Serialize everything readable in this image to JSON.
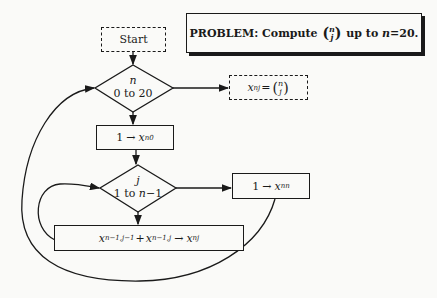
{
  "diagram": {
    "title_box": {
      "prefix": "PROBLEM:",
      "text": "Compute",
      "binom_top": "n",
      "binom_bottom": "j",
      "suffix": "up to",
      "var": "n",
      "eq": "=20."
    },
    "start": {
      "label": "Start"
    },
    "loop_n": {
      "var": "n",
      "range": "0 to 20"
    },
    "output": {
      "var": "x",
      "sub": "nj",
      "eq": "=",
      "binom_top": "n",
      "binom_bottom": "j"
    },
    "init_n0": {
      "value": "1",
      "var": "x",
      "sub": "n0"
    },
    "loop_j": {
      "var": "j",
      "range_start": "1 to ",
      "range_var": "n",
      "range_end": "−1"
    },
    "set_nn": {
      "value": "1",
      "var": "x",
      "sub": "nn"
    },
    "recurrence": {
      "t1_var": "x",
      "t1_sub": "n−1,j−1",
      "plus": "+",
      "t2_var": "x",
      "t2_sub": "n−1,j",
      "target_var": "x",
      "target_sub": "nj"
    },
    "arrow_glyph": "→",
    "colors": {
      "ink": "#1a1a1a",
      "paper": "#fafaf8"
    }
  }
}
